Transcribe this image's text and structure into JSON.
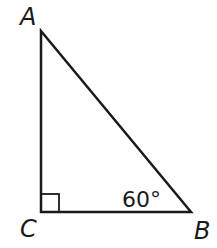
{
  "diagram": {
    "type": "right-triangle",
    "vertices": {
      "A": {
        "label": "A",
        "x": 41,
        "y": 31
      },
      "B": {
        "label": "B",
        "x": 191,
        "y": 212
      },
      "C": {
        "label": "C",
        "x": 41,
        "y": 212
      }
    },
    "right_angle_at": "C",
    "angle_B": {
      "label": "60°",
      "vertex": "B",
      "value_deg": 60
    },
    "colors": {
      "stroke": "#1a1a1a",
      "background": "#ffffff"
    }
  }
}
